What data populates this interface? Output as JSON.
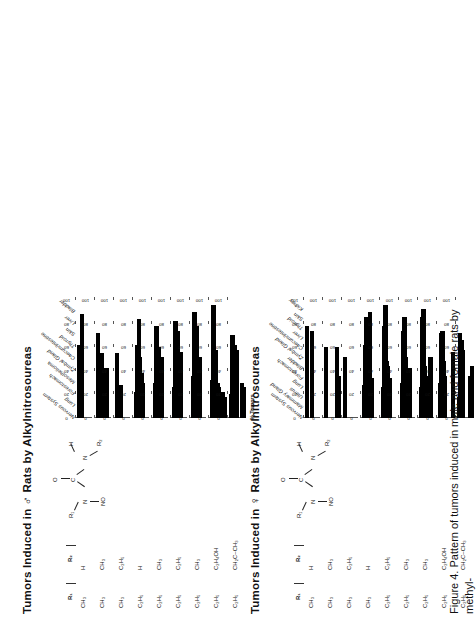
{
  "figure": {
    "caption_line1": "Figure 4. Pattern of tumors  induced  in male and  female rats by methyl-",
    "caption_line2": "and ethyl-nitrosoureas",
    "axis_title": "% Tumors",
    "y_ticks": [
      "100",
      "80",
      "60",
      "40",
      "20",
      "0"
    ],
    "y_max": 100,
    "r1_header": "R₁",
    "r2_header": "R₂",
    "structure": {
      "atoms": [
        "R₁",
        "N",
        "C",
        "N",
        "R₂",
        "O",
        "NO",
        "H"
      ],
      "label_o": "O",
      "label_no": "NO",
      "label_n": "N",
      "label_c": "C",
      "label_h": "H",
      "label_r1": "R₁",
      "label_r2": "R₂"
    }
  },
  "panels": [
    {
      "id": "male",
      "title_before": "Tumors Induced in",
      "sex_symbol": "♂",
      "title_after": "Rats by Alkylnitrosoureas",
      "organs": [
        "Nervous System",
        "Lung",
        "Forestomach",
        "Mesothelioma",
        "Zymbal Gland",
        "Caecum/Intestine",
        "Thyroid",
        "Skin",
        "Liver",
        "Bladder"
      ],
      "compounds": [
        {
          "r1": "CH₃",
          "r2": "H",
          "values": [
            62,
            0,
            88,
            0,
            0,
            0,
            0,
            0,
            0,
            0
          ]
        },
        {
          "r1": "CH₃",
          "r2": "CH₃",
          "values": [
            72,
            0,
            0,
            55,
            0,
            0,
            42,
            0,
            0,
            0
          ]
        },
        {
          "r1": "CH₃",
          "r2": "C₂H₅",
          "values": [
            55,
            0,
            0,
            28,
            0,
            0,
            0,
            0,
            0,
            0
          ]
        },
        {
          "r1": "C₂H₅",
          "r2": "H",
          "values": [
            22,
            62,
            84,
            52,
            38,
            30,
            0,
            0,
            0,
            0
          ]
        },
        {
          "r1": "C₂H₅",
          "r2": "CH₃",
          "values": [
            30,
            78,
            0,
            60,
            34,
            52,
            0,
            0,
            0,
            0
          ]
        },
        {
          "r1": "C₂H₅",
          "r2": "C₂H₅",
          "values": [
            26,
            82,
            0,
            74,
            32,
            56,
            0,
            0,
            0,
            0
          ]
        },
        {
          "r1": "C₂H₅",
          "r2": "CH₃",
          "values": [
            36,
            90,
            0,
            78,
            30,
            52,
            0,
            0,
            0,
            0
          ]
        },
        {
          "r1": "C₂H₅",
          "r2": "C₂H₄OH",
          "values": [
            32,
            96,
            0,
            58,
            30,
            26,
            0,
            0,
            22,
            18
          ]
        },
        {
          "r1": "C₂H₅",
          "r2": "CH₂C–CH₃",
          "values": [
            20,
            70,
            0,
            62,
            58,
            0,
            0,
            0,
            30,
            26
          ]
        }
      ]
    },
    {
      "id": "female",
      "title_before": "Tumors Induced in",
      "sex_symbol": "♀",
      "title_after": "Rats by Alkylnitrosoureas",
      "organs": [
        "Nervous System",
        "Mammary Gland",
        "Uterus",
        "Lung",
        "Forestomach",
        "Bladder",
        "Zymbal Gland",
        "Caecum/Intestine",
        "Liver",
        "Thyroid",
        "Skin",
        "Kidney"
      ],
      "compounds": [
        {
          "r1": "CH₃",
          "r2": "H",
          "values": [
            78,
            0,
            0,
            0,
            74,
            0,
            0,
            0,
            0,
            0,
            0,
            0
          ]
        },
        {
          "r1": "CH₃",
          "r2": "CH₃",
          "values": [
            60,
            0,
            0,
            0,
            0,
            0,
            0,
            0,
            0,
            60,
            0,
            36
          ]
        },
        {
          "r1": "CH₃",
          "r2": "C₂H₅",
          "values": [
            52,
            0,
            0,
            0,
            0,
            0,
            0,
            0,
            0,
            0,
            0,
            0
          ]
        },
        {
          "r1": "CH₃",
          "r2": "H",
          "values": [
            28,
            62,
            86,
            46,
            50,
            90,
            22,
            34,
            0,
            0,
            0,
            0
          ]
        },
        {
          "r1": "C₂H₅",
          "r2": "C₂H₅",
          "values": [
            26,
            78,
            96,
            48,
            44,
            0,
            34,
            0,
            0,
            0,
            0,
            0
          ]
        },
        {
          "r1": "C₂H₅",
          "r2": "CH₃",
          "values": [
            30,
            74,
            86,
            52,
            40,
            0,
            0,
            42,
            0,
            0,
            0,
            0
          ]
        },
        {
          "r1": "C₂H₅",
          "r2": "CH₃",
          "values": [
            26,
            86,
            92,
            44,
            36,
            0,
            0,
            28,
            52,
            0,
            0,
            0
          ]
        },
        {
          "r1": "C₂H₅",
          "r2": "C₂H₄OH",
          "values": [
            30,
            72,
            74,
            48,
            36,
            0,
            0,
            0,
            0,
            0,
            0,
            56
          ]
        },
        {
          "r1": "C₂H₅",
          "r2": "CH₂C–CH₃",
          "values": [
            18,
            72,
            66,
            58,
            0,
            0,
            0,
            0,
            0,
            36,
            0,
            44
          ]
        }
      ]
    }
  ],
  "chart_data": {
    "type": "bar",
    "xlabel": "% Tumors",
    "ylabel": "",
    "ylim": [
      0,
      100
    ],
    "grid": false,
    "legend": "none",
    "orientation": "horizontal",
    "panels": [
      {
        "name": "Tumors Induced in ♂ Rats by Alkylnitrosoureas",
        "categories": [
          "Nervous System",
          "Lung",
          "Forestomach",
          "Mesothelioma",
          "Zymbal Gland",
          "Caecum/Intestine",
          "Thyroid",
          "Skin",
          "Liver",
          "Bladder"
        ],
        "series": [
          {
            "name": "R1=CH3, R2=H",
            "values": [
              62,
              0,
              88,
              0,
              0,
              0,
              0,
              0,
              0,
              0
            ]
          },
          {
            "name": "R1=CH3, R2=CH3",
            "values": [
              72,
              0,
              0,
              55,
              0,
              0,
              42,
              0,
              0,
              0
            ]
          },
          {
            "name": "R1=CH3, R2=C2H5",
            "values": [
              55,
              0,
              0,
              28,
              0,
              0,
              0,
              0,
              0,
              0
            ]
          },
          {
            "name": "R1=C2H5, R2=H",
            "values": [
              22,
              62,
              84,
              52,
              38,
              30,
              0,
              0,
              0,
              0
            ]
          },
          {
            "name": "R1=C2H5, R2=CH3",
            "values": [
              30,
              78,
              0,
              60,
              34,
              52,
              0,
              0,
              0,
              0
            ]
          },
          {
            "name": "R1=C2H5, R2=C2H5",
            "values": [
              26,
              82,
              0,
              74,
              32,
              56,
              0,
              0,
              0,
              0
            ]
          },
          {
            "name": "R1=C2H5, R2=CH3 (b)",
            "values": [
              36,
              90,
              0,
              78,
              30,
              52,
              0,
              0,
              0,
              0
            ]
          },
          {
            "name": "R1=C2H5, R2=C2H4OH",
            "values": [
              32,
              96,
              0,
              58,
              30,
              26,
              0,
              0,
              22,
              18
            ]
          },
          {
            "name": "R1=C2H5, R2=CH2C(O)CH3",
            "values": [
              20,
              70,
              0,
              62,
              58,
              0,
              0,
              0,
              30,
              26
            ]
          }
        ]
      },
      {
        "name": "Tumors Induced in ♀ Rats by Alkylnitrosoureas",
        "categories": [
          "Nervous System",
          "Mammary Gland",
          "Uterus",
          "Lung",
          "Forestomach",
          "Bladder",
          "Zymbal Gland",
          "Caecum/Intestine",
          "Liver",
          "Thyroid",
          "Skin",
          "Kidney"
        ],
        "series": [
          {
            "name": "R1=CH3, R2=H",
            "values": [
              78,
              0,
              0,
              0,
              74,
              0,
              0,
              0,
              0,
              0,
              0,
              0
            ]
          },
          {
            "name": "R1=CH3, R2=CH3",
            "values": [
              60,
              0,
              0,
              0,
              0,
              0,
              0,
              0,
              0,
              60,
              0,
              36
            ]
          },
          {
            "name": "R1=CH3, R2=C2H5",
            "values": [
              52,
              0,
              0,
              0,
              0,
              0,
              0,
              0,
              0,
              0,
              0,
              0
            ]
          },
          {
            "name": "R1=CH3, R2=H (b)",
            "values": [
              28,
              62,
              86,
              46,
              50,
              90,
              22,
              34,
              0,
              0,
              0,
              0
            ]
          },
          {
            "name": "R1=C2H5, R2=C2H5",
            "values": [
              26,
              78,
              96,
              48,
              44,
              0,
              34,
              0,
              0,
              0,
              0,
              0
            ]
          },
          {
            "name": "R1=C2H5, R2=CH3",
            "values": [
              30,
              74,
              86,
              52,
              40,
              0,
              0,
              42,
              0,
              0,
              0,
              0
            ]
          },
          {
            "name": "R1=C2H5, R2=CH3 (b)",
            "values": [
              26,
              86,
              92,
              44,
              36,
              0,
              0,
              28,
              52,
              0,
              0,
              0
            ]
          },
          {
            "name": "R1=C2H5, R2=C2H4OH",
            "values": [
              30,
              72,
              74,
              48,
              36,
              0,
              0,
              0,
              0,
              0,
              0,
              56
            ]
          },
          {
            "name": "R1=C2H5, R2=CH2C(O)CH3",
            "values": [
              18,
              72,
              66,
              58,
              0,
              0,
              0,
              0,
              0,
              36,
              0,
              44
            ]
          }
        ]
      }
    ]
  }
}
